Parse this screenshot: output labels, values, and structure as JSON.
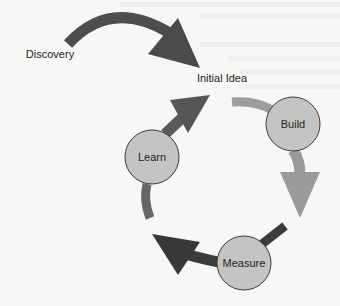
{
  "diagram": {
    "type": "cycle",
    "title": "",
    "entry": {
      "label": "Discovery",
      "points_to": "Initial Idea"
    },
    "start_label": "Initial Idea",
    "nodes": [
      {
        "id": "build",
        "label": "Build"
      },
      {
        "id": "measure",
        "label": "Measure"
      },
      {
        "id": "learn",
        "label": "Learn"
      }
    ],
    "edges": [
      {
        "from": "Discovery",
        "to": "Initial Idea"
      },
      {
        "from": "Initial Idea",
        "to": "Build"
      },
      {
        "from": "Build",
        "to": "Measure"
      },
      {
        "from": "Measure",
        "to": "Learn"
      },
      {
        "from": "Learn",
        "to": "Initial Idea"
      }
    ],
    "colors": {
      "background": "#f7f7f5",
      "node_fill": "#c4c4c2",
      "node_stroke": "#3a3a3a",
      "arrow_dark": "#4a4a4a",
      "arrow_darker": "#3b3b3b",
      "arrow_medium": "#6a6a6a",
      "arrow_light": "#9a9a9a",
      "text": "#1e1e1e"
    }
  }
}
